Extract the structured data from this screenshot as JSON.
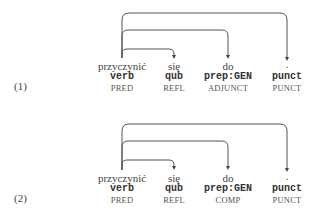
{
  "examples": [
    {
      "number": "(1)",
      "tokens": [
        {
          "word": "przyczynić",
          "tag": "verb",
          "label": "PRED"
        },
        {
          "word": "się",
          "tag": "qub",
          "label": "REFL"
        },
        {
          "word": "do",
          "tag": "prep:GEN",
          "label": "ADJUNCT"
        },
        {
          "word": ".",
          "tag": "punct",
          "label": "PUNCT"
        }
      ],
      "arcs": [
        {
          "from": 0,
          "to": 1
        },
        {
          "from": 0,
          "to": 2
        },
        {
          "from": 0,
          "to": 3
        }
      ]
    },
    {
      "number": "(2)",
      "tokens": [
        {
          "word": "przyczynić",
          "tag": "verb",
          "label": "PRED"
        },
        {
          "word": "się",
          "tag": "qub",
          "label": "REFL"
        },
        {
          "word": "do",
          "tag": "prep:GEN",
          "label": "COMP"
        },
        {
          "word": ".",
          "tag": "punct",
          "label": "PUNCT"
        }
      ],
      "arcs": [
        {
          "from": 0,
          "to": 1
        },
        {
          "from": 0,
          "to": 2
        },
        {
          "from": 0,
          "to": 3
        }
      ]
    }
  ]
}
